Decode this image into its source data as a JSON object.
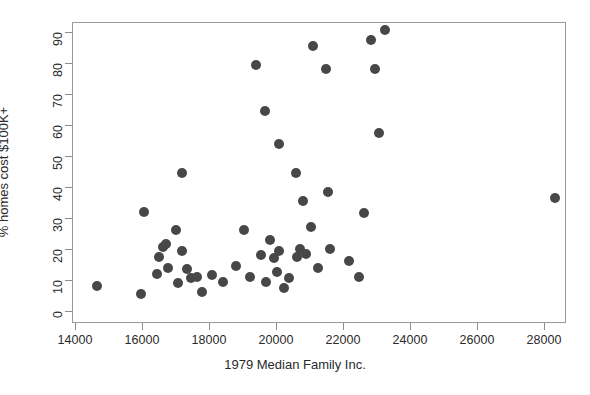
{
  "chart_data": {
    "type": "scatter",
    "title": "",
    "xlabel": "1979 Median Family Inc.",
    "ylabel": "% homes cost $100K+",
    "xlim": [
      13200,
      29000
    ],
    "ylim": [
      -3,
      94
    ],
    "xticks": [
      14000,
      16000,
      18000,
      20000,
      22000,
      24000,
      26000,
      28000
    ],
    "xtick_labels": [
      "14000",
      "16000",
      "18000",
      "20000",
      "22000",
      "24000",
      "26000",
      "28000"
    ],
    "yticks": [
      0,
      10,
      20,
      30,
      40,
      50,
      60,
      70,
      80,
      90
    ],
    "ytick_labels": [
      "0",
      "10",
      "20",
      "30",
      "40",
      "50",
      "60",
      "70",
      "80",
      "90"
    ],
    "grid": false,
    "legend": null,
    "marker": {
      "shape": "circle",
      "color": "#474747",
      "size_px": 10
    },
    "points": [
      {
        "x": 14650,
        "y": 8.0
      },
      {
        "x": 15960,
        "y": 5.5
      },
      {
        "x": 16060,
        "y": 32.0
      },
      {
        "x": 16440,
        "y": 12.0
      },
      {
        "x": 16500,
        "y": 17.5
      },
      {
        "x": 16620,
        "y": 20.5
      },
      {
        "x": 16720,
        "y": 21.5
      },
      {
        "x": 16790,
        "y": 14.0
      },
      {
        "x": 17000,
        "y": 26.0
      },
      {
        "x": 17060,
        "y": 9.0
      },
      {
        "x": 17180,
        "y": 44.5
      },
      {
        "x": 17200,
        "y": 19.5
      },
      {
        "x": 17330,
        "y": 13.5
      },
      {
        "x": 17460,
        "y": 10.5
      },
      {
        "x": 17650,
        "y": 11.0
      },
      {
        "x": 17800,
        "y": 6.0
      },
      {
        "x": 18080,
        "y": 11.5
      },
      {
        "x": 18420,
        "y": 9.5
      },
      {
        "x": 18800,
        "y": 14.5
      },
      {
        "x": 19050,
        "y": 26.0
      },
      {
        "x": 19230,
        "y": 11.0
      },
      {
        "x": 19400,
        "y": 79.5
      },
      {
        "x": 19560,
        "y": 18.0
      },
      {
        "x": 19660,
        "y": 64.5
      },
      {
        "x": 19700,
        "y": 9.5
      },
      {
        "x": 19820,
        "y": 23.0
      },
      {
        "x": 19950,
        "y": 17.0
      },
      {
        "x": 20030,
        "y": 12.5
      },
      {
        "x": 20090,
        "y": 54.0
      },
      {
        "x": 20100,
        "y": 19.5
      },
      {
        "x": 20230,
        "y": 7.5
      },
      {
        "x": 20400,
        "y": 10.5
      },
      {
        "x": 20600,
        "y": 44.5
      },
      {
        "x": 20640,
        "y": 17.5
      },
      {
        "x": 20730,
        "y": 20.0
      },
      {
        "x": 20800,
        "y": 35.5
      },
      {
        "x": 20900,
        "y": 18.5
      },
      {
        "x": 21050,
        "y": 27.0
      },
      {
        "x": 21100,
        "y": 85.5
      },
      {
        "x": 21250,
        "y": 14.0
      },
      {
        "x": 21480,
        "y": 78.0
      },
      {
        "x": 21560,
        "y": 38.5
      },
      {
        "x": 21600,
        "y": 20.0
      },
      {
        "x": 22180,
        "y": 16.0
      },
      {
        "x": 22480,
        "y": 11.0
      },
      {
        "x": 22640,
        "y": 31.5
      },
      {
        "x": 22840,
        "y": 87.5
      },
      {
        "x": 22960,
        "y": 78.0
      },
      {
        "x": 23060,
        "y": 57.5
      },
      {
        "x": 23240,
        "y": 90.5
      },
      {
        "x": 28330,
        "y": 36.5
      }
    ]
  }
}
